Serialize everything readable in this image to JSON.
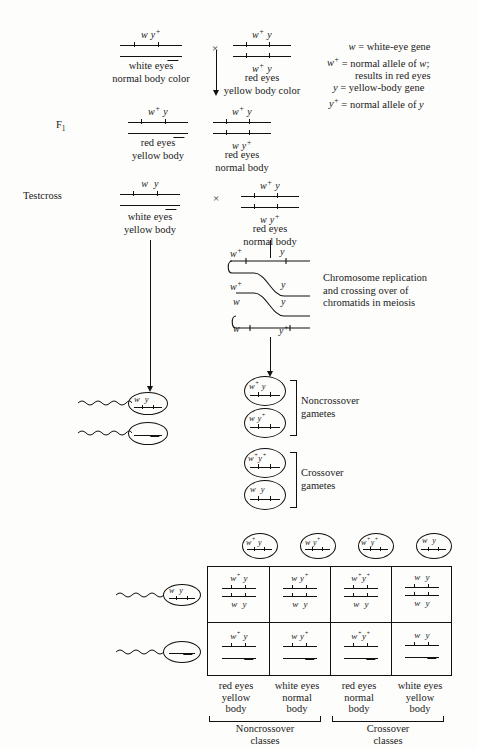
{
  "legend": {
    "lines": [
      "w = white-eye gene",
      "w+ = normal allele of w;",
      "results in red eyes",
      "y = yellow-body gene",
      "y+ = normal allele of y"
    ],
    "l1_gene": "w",
    "l1_text": "= white-eye gene",
    "l2_gene": "w",
    "l2_sup": "+",
    "l2_text": "= normal allele of w;",
    "l3_text": "results in red eyes",
    "l4_gene": "y",
    "l4_text": "= yellow-body gene",
    "l5_gene": "y",
    "l5_sup": "+",
    "l5_text": "= normal allele of y"
  },
  "row_labels": {
    "f1": "F",
    "f1_sub": "1",
    "testcross": "Testcross"
  },
  "cross_symbol": "×",
  "parents": {
    "male": {
      "x_alleles": "w y+",
      "x_top": "w",
      "x_top_sup": "+at-y",
      "phenotype_line1": "white eyes",
      "phenotype_line2": "normal body color",
      "sex": "male"
    },
    "female": {
      "top_alleles": "w+ y",
      "bottom_alleles": "w+ y",
      "phenotype_line1": "red eyes",
      "phenotype_line2": "yellow body color",
      "sex": "female"
    }
  },
  "f1": {
    "male": {
      "x_alleles": "w+ y",
      "phenotype_line1": "red eyes",
      "phenotype_line2": "yellow body"
    },
    "female": {
      "top_alleles": "w+ y",
      "bottom_alleles": "w y+",
      "phenotype_line1": "red eyes",
      "phenotype_line2": "normal body"
    }
  },
  "testcross": {
    "male": {
      "x_alleles": "w y",
      "phenotype_line1": "white eyes",
      "phenotype_line2": "yellow body"
    },
    "female": {
      "top_alleles": "w+ y",
      "bottom_alleles": "w y+",
      "phenotype_line1": "red eyes",
      "phenotype_line2": "normal body"
    }
  },
  "meiosis": {
    "caption_line1": "Chromosome replication",
    "caption_line2": "and crossing over of",
    "caption_line3": "chromatids in meiosis",
    "chromatid_labels_left": [
      "w+",
      "w+",
      "w",
      "w"
    ],
    "chromatid_labels_right": [
      "y",
      "y",
      "y",
      "y+"
    ]
  },
  "gametes": {
    "noncrossover_label_line1": "Noncrossover",
    "noncrossover_label_line2": "gametes",
    "crossover_label_line1": "Crossover",
    "crossover_label_line2": "gametes",
    "items": [
      {
        "left": "w+",
        "right": "y",
        "type": "noncrossover"
      },
      {
        "left": "w",
        "right": "y+",
        "type": "noncrossover"
      },
      {
        "left": "w+",
        "right": "y+",
        "type": "crossover"
      },
      {
        "left": "w",
        "right": "y",
        "type": "crossover"
      }
    ]
  },
  "sperm": {
    "x_bearing": {
      "left": "w",
      "right": "y"
    },
    "y_bearing": {
      "label": ""
    }
  },
  "punnett": {
    "column_headers": [
      {
        "left": "w+",
        "right": "y"
      },
      {
        "left": "w",
        "right": "y+"
      },
      {
        "left": "w+",
        "right": "y+"
      },
      {
        "left": "w",
        "right": "y"
      }
    ],
    "row1_cells": [
      {
        "top": "w+ y",
        "bottom": "w y"
      },
      {
        "top": "w y+",
        "bottom": "w y"
      },
      {
        "top": "w+ y+",
        "bottom": "w y"
      },
      {
        "top": "w y",
        "bottom": "w y"
      }
    ],
    "row2_cells": [
      {
        "top": "w+ y"
      },
      {
        "top": "w y+"
      },
      {
        "top": "w+ y+"
      },
      {
        "top": "w y"
      }
    ],
    "phenotypes": [
      {
        "l1": "red eyes",
        "l2": "yellow",
        "l3": "body"
      },
      {
        "l1": "white eyes",
        "l2": "normal",
        "l3": "body"
      },
      {
        "l1": "red eyes",
        "l2": "normal",
        "l3": "body"
      },
      {
        "l1": "white eyes",
        "l2": "yellow",
        "l3": "body"
      }
    ],
    "class_labels": [
      {
        "l1": "Noncrossover",
        "l2": "classes"
      },
      {
        "l1": "Crossover",
        "l2": "classes"
      }
    ]
  }
}
